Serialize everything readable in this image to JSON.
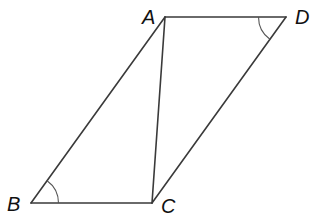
{
  "diagram": {
    "type": "parallelogram-with-diagonal",
    "vertices": [
      {
        "id": "A",
        "label": "A"
      },
      {
        "id": "B",
        "label": "B"
      },
      {
        "id": "C",
        "label": "C"
      },
      {
        "id": "D",
        "label": "D"
      }
    ],
    "segments": [
      {
        "from": "A",
        "to": "D"
      },
      {
        "from": "A",
        "to": "B"
      },
      {
        "from": "B",
        "to": "C"
      },
      {
        "from": "C",
        "to": "D"
      },
      {
        "from": "A",
        "to": "C"
      }
    ],
    "angle_marks": [
      {
        "vertex": "B",
        "between": [
          "A",
          "C"
        ],
        "arcs": 1
      },
      {
        "vertex": "D",
        "between": [
          "A",
          "C"
        ],
        "arcs": 1
      }
    ]
  }
}
